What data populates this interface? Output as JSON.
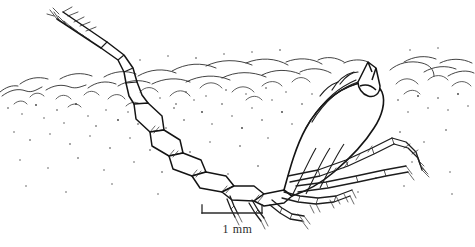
{
  "figure": {
    "kind": "scientific-line-drawing",
    "background_color": "#ffffff",
    "ink_color": "#1d1d1d",
    "stipple_color": "#3a3a3a",
    "width_px": 475,
    "height_px": 247
  },
  "scalebar": {
    "label": "1 mm",
    "x_start_px": 202,
    "x_end_px": 262,
    "y_px": 213,
    "tick_height_px": 8,
    "line_color": "#2b2b2b"
  },
  "illustration": {
    "antenna_label": "antenna",
    "body_label": "body",
    "legs_label": "pereopods",
    "substrate_label": "sediment"
  }
}
